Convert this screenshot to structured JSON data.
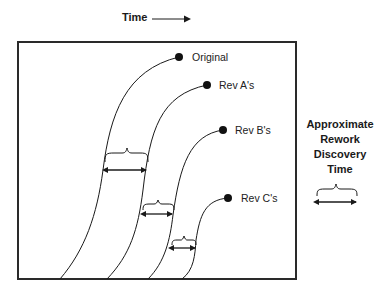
{
  "diagram": {
    "axis": {
      "label": "Time",
      "arrow": "right-arrow"
    },
    "curves": [
      {
        "label": "Original",
        "start": [
          60,
          279
        ],
        "end": [
          179,
          57
        ]
      },
      {
        "label": "Rev A's",
        "start": [
          107,
          279
        ],
        "end": [
          207,
          85
        ]
      },
      {
        "label": "Rev B's",
        "start": [
          148,
          279
        ],
        "end": [
          223,
          130
        ]
      },
      {
        "label": "Rev C's",
        "start": [
          182,
          279
        ],
        "end": [
          228,
          198
        ]
      }
    ],
    "intervals": [
      {
        "between": [
          "Original",
          "Rev A's"
        ]
      },
      {
        "between": [
          "Rev A's",
          "Rev B's"
        ]
      },
      {
        "between": [
          "Rev B's",
          "Rev C's"
        ]
      }
    ],
    "legend": {
      "title_lines": [
        "Approximate",
        "Rework",
        "Discovery",
        "Time"
      ],
      "symbol": "brace-with-double-arrow"
    },
    "colors": {
      "line": "#1a1a1a",
      "frame": "#2a2a2a",
      "background": "#ffffff"
    }
  }
}
